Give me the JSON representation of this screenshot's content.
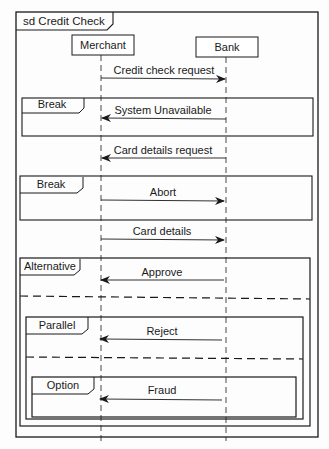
{
  "diagram": {
    "type": "UML sequence diagram",
    "title": "sd Credit Check",
    "lifelines": [
      {
        "id": "merchant",
        "label": "Merchant"
      },
      {
        "id": "bank",
        "label": "Bank"
      }
    ],
    "messages": [
      {
        "id": "m1",
        "label": "Credit check request",
        "from": "merchant",
        "to": "bank"
      },
      {
        "id": "m2",
        "label": "System Unavailable",
        "from": "bank",
        "to": "merchant",
        "fragment": "break1"
      },
      {
        "id": "m3",
        "label": "Card details request",
        "from": "bank",
        "to": "merchant"
      },
      {
        "id": "m4",
        "label": "Abort",
        "from": "merchant",
        "to": "bank",
        "fragment": "break2"
      },
      {
        "id": "m5",
        "label": "Card details",
        "from": "merchant",
        "to": "bank"
      },
      {
        "id": "m6",
        "label": "Approve",
        "from": "bank",
        "to": "merchant",
        "fragment": "alternative"
      },
      {
        "id": "m7",
        "label": "Reject",
        "from": "bank",
        "to": "merchant",
        "fragment": "parallel"
      },
      {
        "id": "m8",
        "label": "Fraud",
        "from": "bank",
        "to": "merchant",
        "fragment": "option"
      }
    ],
    "fragments": [
      {
        "id": "break1",
        "operator": "Break"
      },
      {
        "id": "break2",
        "operator": "Break"
      },
      {
        "id": "alternative",
        "operator": "Alternative"
      },
      {
        "id": "parallel",
        "operator": "Parallel"
      },
      {
        "id": "option",
        "operator": "Option"
      }
    ]
  }
}
